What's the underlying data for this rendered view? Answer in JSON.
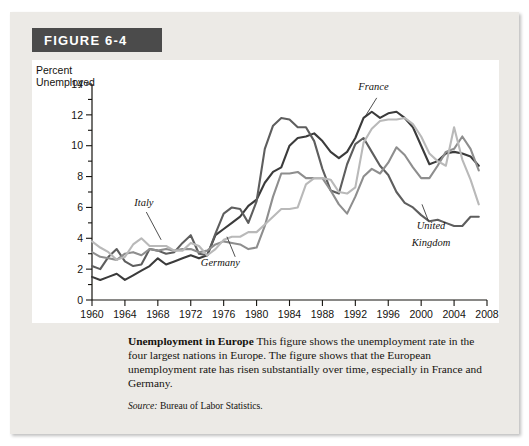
{
  "figure": {
    "banner_label": "FIGURE 6-4"
  },
  "caption": {
    "title": "Unemployment in Europe",
    "body": " This figure shows the unemployment rate in the four largest nations in Europe. The figure shows that the European unemployment rate has risen substantially over time, especially in France and Germany.",
    "source_label": "Source:",
    "source_text": " Bureau of Labor Statistics."
  },
  "colors": {
    "banner_bg": "#4b4b4b",
    "card_bg": "#eceae6",
    "plot_bg": "#ffffff",
    "france": "#3b3b3b",
    "germany": "#8e8e8e",
    "italy": "#b9b9b9",
    "united_kingdom": "#5e5e5e",
    "axis": "#15130f"
  },
  "chart_data": {
    "type": "line",
    "title": "Unemployment in Europe",
    "xlabel": "Year",
    "ylabel": "Percent Unemployed",
    "ylabel_line1": "Percent",
    "ylabel_line2": "Unemployed",
    "xlim": [
      1960,
      2008
    ],
    "ylim": [
      0,
      14
    ],
    "ytick_step": 2,
    "yticks": [
      0,
      2,
      4,
      6,
      8,
      10,
      12,
      14
    ],
    "yminor_step": 1,
    "xticks": [
      1960,
      1964,
      1968,
      1972,
      1976,
      1980,
      1984,
      1988,
      1992,
      1996,
      2000,
      2004,
      2008
    ],
    "xtick_step": 4,
    "grid": false,
    "legend": "inline-annotations",
    "annotations": [
      {
        "text": "Italy",
        "series": "Italy",
        "x": 1966.3,
        "y": 6.1
      },
      {
        "text": "Germany",
        "series": "Germany",
        "x": 1975.6,
        "y": 2.2
      },
      {
        "text": "France",
        "series": "France",
        "x": 1994.2,
        "y": 13.6
      },
      {
        "text": "United",
        "series": "United Kingdom",
        "x": 2001.2,
        "y": 4.6
      },
      {
        "text": "Kingdom",
        "series": "United Kingdom",
        "x": 2001.2,
        "y": 3.5
      }
    ],
    "x": [
      1960,
      1961,
      1962,
      1963,
      1964,
      1965,
      1966,
      1967,
      1968,
      1969,
      1970,
      1971,
      1972,
      1973,
      1974,
      1975,
      1976,
      1977,
      1978,
      1979,
      1980,
      1981,
      1982,
      1983,
      1984,
      1985,
      1986,
      1987,
      1988,
      1989,
      1990,
      1991,
      1992,
      1993,
      1994,
      1995,
      1996,
      1997,
      1998,
      1999,
      2000,
      2001,
      2002,
      2003,
      2004,
      2005,
      2006,
      2007
    ],
    "series": [
      {
        "name": "France",
        "color": "#3b3b3b",
        "values": [
          1.5,
          1.3,
          1.5,
          1.7,
          1.3,
          1.6,
          1.9,
          2.2,
          2.7,
          2.3,
          2.5,
          2.7,
          2.9,
          2.7,
          2.9,
          4.2,
          4.6,
          5.0,
          5.4,
          6.1,
          6.5,
          7.6,
          8.3,
          8.6,
          10.0,
          10.5,
          10.6,
          10.8,
          10.3,
          9.6,
          9.2,
          9.6,
          10.5,
          11.8,
          12.2,
          11.8,
          12.1,
          12.2,
          11.8,
          11.2,
          10.0,
          8.8,
          9.0,
          9.5,
          9.6,
          9.5,
          9.3,
          8.7
        ]
      },
      {
        "name": "United Kingdom",
        "color": "#5e5e5e",
        "values": [
          2.2,
          2.0,
          2.8,
          3.3,
          2.5,
          2.2,
          2.3,
          3.3,
          3.2,
          3.0,
          3.1,
          3.7,
          4.2,
          3.0,
          2.9,
          4.3,
          5.6,
          6.0,
          5.9,
          5.0,
          6.4,
          9.8,
          11.3,
          11.8,
          11.7,
          11.2,
          11.2,
          10.3,
          8.5,
          7.1,
          6.9,
          8.8,
          10.1,
          10.5,
          9.6,
          8.7,
          8.1,
          7.0,
          6.3,
          6.0,
          5.5,
          5.1,
          5.2,
          5.0,
          4.8,
          4.8,
          5.4,
          5.4
        ]
      },
      {
        "name": "Germany",
        "color": "#8e8e8e",
        "values": [
          3.1,
          2.8,
          2.7,
          2.6,
          3.0,
          3.1,
          2.9,
          3.3,
          3.2,
          3.3,
          3.2,
          3.3,
          3.3,
          3.1,
          3.2,
          3.6,
          3.8,
          3.7,
          3.6,
          3.3,
          3.4,
          4.8,
          6.7,
          8.2,
          8.2,
          8.3,
          7.9,
          7.9,
          7.9,
          7.1,
          6.2,
          5.6,
          6.7,
          8.0,
          8.5,
          8.2,
          8.9,
          9.9,
          9.4,
          8.6,
          7.9,
          7.9,
          8.7,
          9.6,
          9.8,
          10.6,
          9.8,
          8.4
        ]
      },
      {
        "name": "Italy",
        "color": "#b9b9b9",
        "values": [
          3.8,
          3.4,
          3.1,
          2.6,
          2.8,
          3.6,
          4.0,
          3.5,
          3.5,
          3.5,
          3.2,
          3.2,
          3.7,
          3.5,
          2.9,
          3.3,
          3.9,
          4.1,
          4.1,
          4.4,
          4.4,
          4.9,
          5.4,
          5.9,
          5.9,
          6.0,
          7.5,
          7.9,
          7.9,
          7.8,
          7.0,
          6.9,
          7.3,
          10.2,
          11.1,
          11.6,
          11.7,
          11.7,
          11.8,
          11.4,
          10.6,
          9.5,
          9.0,
          8.7,
          11.2,
          9.1,
          7.8,
          6.2
        ]
      }
    ]
  }
}
